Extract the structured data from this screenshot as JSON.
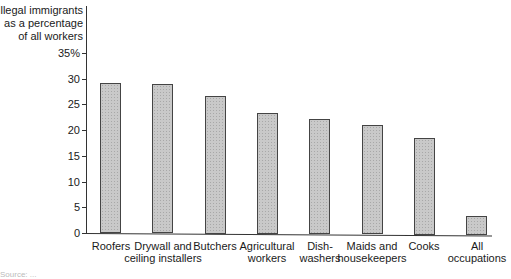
{
  "chart_data": {
    "type": "bar",
    "title": "",
    "ylabel": "Illegal immigrants as a percentage of all workers",
    "ylabel_lines": [
      "Illegal immigrants",
      "as a percentage",
      "of all workers"
    ],
    "xlabel": "",
    "ylim": [
      0,
      35
    ],
    "yticks": [
      "0",
      "5",
      "10",
      "15",
      "20",
      "25",
      "30",
      "35%"
    ],
    "grid": false,
    "legend": null,
    "categories": [
      "Roofers",
      "Drywall and ceiling installers",
      "Butchers",
      "Agricultural workers",
      "Dish-washers",
      "Maids and housekeepers",
      "Cooks",
      "All occupations"
    ],
    "category_lines": [
      [
        "Roofers"
      ],
      [
        "Drywall and",
        "ceiling installers"
      ],
      [
        "Butchers"
      ],
      [
        "Agricultural",
        "workers"
      ],
      [
        "Dish-",
        "washers"
      ],
      [
        "Maids and",
        "housekeepers"
      ],
      [
        "Cooks"
      ],
      [
        "All",
        "occupations"
      ]
    ],
    "values": [
      29.2,
      29.0,
      26.8,
      23.5,
      22.4,
      21.2,
      18.9,
      3.7
    ]
  },
  "source_note": "Source: ..."
}
